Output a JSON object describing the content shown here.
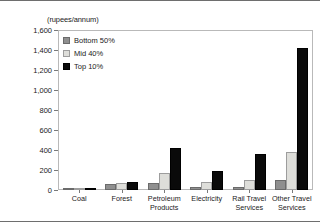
{
  "chart_data": {
    "type": "bar",
    "title": "",
    "subtitle": "",
    "xlabel": "",
    "ylabel": "(rupees/annum)",
    "ylim": [
      0,
      1600
    ],
    "yticks": [
      0,
      200,
      400,
      600,
      800,
      1000,
      1200,
      1400,
      1600
    ],
    "ytick_labels": [
      "0",
      "200",
      "400",
      "600",
      "800",
      "1,000",
      "1,200",
      "1,400",
      "1,600"
    ],
    "grid": false,
    "legend_position": "top-left inside plot",
    "categories": [
      "Coal",
      "Forest",
      "Petroleum Products",
      "Electricity",
      "Rail Travel Services",
      "Other Travel Services"
    ],
    "category_label_lines": [
      [
        "Coal"
      ],
      [
        "Forest"
      ],
      [
        "Petroleum",
        "Products"
      ],
      [
        "Electricity"
      ],
      [
        "Rail Travel",
        "Services"
      ],
      [
        "Other Travel",
        "Services"
      ]
    ],
    "series": [
      {
        "name": "Bottom 50%",
        "color": "#8f8f8f",
        "values": [
          10,
          60,
          70,
          35,
          30,
          105
        ]
      },
      {
        "name": "Mid 40%",
        "color": "#dededa",
        "values": [
          15,
          70,
          170,
          80,
          105,
          380
        ]
      },
      {
        "name": "Top 10%",
        "color": "#0a0a0a",
        "values": [
          25,
          85,
          425,
          190,
          360,
          1420
        ]
      }
    ]
  }
}
